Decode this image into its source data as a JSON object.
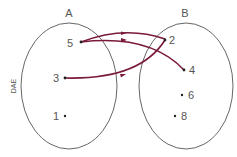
{
  "diagram": {
    "type": "mapping",
    "side_label": "DAE",
    "arrow_color": "#7a1a3a",
    "sets": [
      {
        "name": "A",
        "elements": [
          "5",
          "3",
          "1"
        ]
      },
      {
        "name": "B",
        "elements": [
          "2",
          "4",
          "6",
          "8"
        ]
      }
    ],
    "mappings": [
      {
        "from": "5",
        "to": "2"
      },
      {
        "from": "5",
        "to": "4"
      },
      {
        "from": "3",
        "to": "2"
      }
    ]
  },
  "labels": {
    "set_a": "A",
    "set_b": "B",
    "side": "DAE",
    "a5": "5",
    "a3": "3",
    "a1": "1",
    "b2": "2",
    "b4": "4",
    "b6": "6",
    "b8": "8"
  }
}
